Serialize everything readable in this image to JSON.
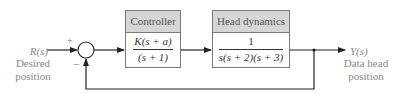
{
  "diagram": {
    "type": "feedback-control-block-diagram",
    "input": {
      "signal": "R(s)",
      "label_line1": "Desired",
      "label_line2": "position"
    },
    "output": {
      "signal": "Y(s)",
      "label_line1": "Data head",
      "label_line2": "position"
    },
    "summing_junction": {
      "plus_sign": "+",
      "minus_sign": "−"
    },
    "blocks": [
      {
        "title": "Controller",
        "numerator": "K(s + a)",
        "denominator": "(s + 1)"
      },
      {
        "title": "Head dynamics",
        "numerator": "1",
        "denominator": "s(s + 2)(s + 3)"
      }
    ],
    "feedback": "unity negative feedback from output to summing junction",
    "colors": {
      "line": "#222222",
      "header_fill": "#d6d6d6",
      "box_border": "#7a7a7a",
      "label_text": "#888888"
    }
  }
}
